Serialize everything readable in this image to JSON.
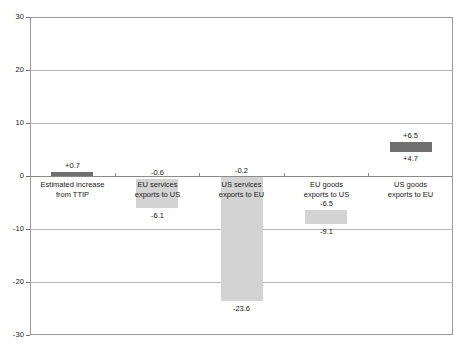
{
  "chart_data": {
    "type": "bar",
    "title": "",
    "subtitle": "",
    "xlabel": "",
    "ylabel": "",
    "ylim": [
      -30,
      30
    ],
    "yticks": [
      30,
      20,
      10,
      0,
      -10,
      -20,
      -30
    ],
    "ytick_labels": [
      "30",
      "20",
      "10",
      "0",
      "-10",
      "-20",
      "-30"
    ],
    "grid": true,
    "legend": "none",
    "bar_style": "floating-range",
    "note": "Each category is a floating bar spanning from its upper value to its lower value.",
    "categories": [
      "Estimated increase from TTIP",
      "EU services exports to US",
      "US services exports to EU",
      "EU goods exports to US",
      "US goods exports to EU"
    ],
    "category_lines": [
      [
        "Estimated increase",
        "from TTIP"
      ],
      [
        "EU services",
        "exports to US"
      ],
      [
        "US services",
        "exports to EU"
      ],
      [
        "EU goods",
        "exports to US"
      ],
      [
        "US goods",
        "exports to EU"
      ]
    ],
    "bars": [
      {
        "category": "Estimated increase from TTIP",
        "top": 0.7,
        "bottom": 0.0,
        "top_label": "+0.7",
        "bottom_label": "",
        "color": "#6f6f6f",
        "shade": "dark"
      },
      {
        "category": "EU services exports to US",
        "top": -0.6,
        "bottom": -6.1,
        "top_label": "-0.6",
        "bottom_label": "-6.1",
        "color": "#d3d3d3",
        "shade": "light"
      },
      {
        "category": "US services exports to EU",
        "top": -0.2,
        "bottom": -23.6,
        "top_label": "-0.2",
        "bottom_label": "-23.6",
        "color": "#d3d3d3",
        "shade": "light"
      },
      {
        "category": "EU goods exports to US",
        "top": -6.5,
        "bottom": -9.1,
        "top_label": "-6.5",
        "bottom_label": "-9.1",
        "color": "#d3d3d3",
        "shade": "light"
      },
      {
        "category": "US goods exports to EU",
        "top": 6.5,
        "bottom": 4.7,
        "top_label": "+6.5",
        "bottom_label": "+4.7",
        "color": "#6f6f6f",
        "shade": "dark"
      }
    ],
    "colors": {
      "dark_bar": "#6f6f6f",
      "light_bar": "#d3d3d3",
      "gridline": "#b4b4b4",
      "axis": "#8a8a8a",
      "text": "#1a1a1a",
      "background": "#ffffff"
    }
  }
}
